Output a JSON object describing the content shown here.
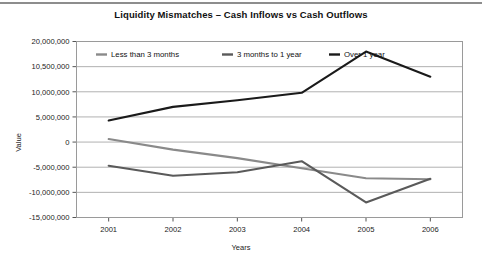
{
  "chart_data": {
    "type": "line",
    "title": "Liquidity Mismatches – Cash Inflows vs Cash Outflows",
    "xlabel": "Years",
    "ylabel": "Value",
    "categories": [
      "2001",
      "2002",
      "2003",
      "2004",
      "2005",
      "2006"
    ],
    "ytick_labels": [
      "20,000,000",
      "10,500,000",
      "10,000,000",
      "5,000,000",
      "0",
      "-5,000,000",
      "-10,000,000",
      "-15,000,000"
    ],
    "ytick_values": [
      20000000,
      15000000,
      10000000,
      5000000,
      0,
      -5000000,
      -10000000,
      -15000000
    ],
    "ylim": [
      -15000000,
      20000000
    ],
    "grid": true,
    "legend_position": "top-inside",
    "series": [
      {
        "name": "Less than 3 months",
        "color": "#8a8a8a",
        "values": [
          600000,
          -1500000,
          -3200000,
          -5200000,
          -7200000,
          -7400000
        ]
      },
      {
        "name": "3 months to 1 year",
        "color": "#5a5a5a",
        "values": [
          -4700000,
          -6700000,
          -6000000,
          -3800000,
          -12000000,
          -7300000
        ]
      },
      {
        "name": "Over 1 year",
        "color": "#1a1a1a",
        "values": [
          4300000,
          7000000,
          8300000,
          9800000,
          18000000,
          13000000
        ]
      }
    ]
  },
  "legend": {
    "items": [
      {
        "label": "Less than 3 months"
      },
      {
        "label": "3 months to 1 year"
      },
      {
        "label": "Over 1 year"
      }
    ]
  }
}
